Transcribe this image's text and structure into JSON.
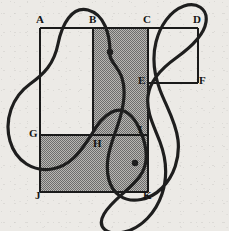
{
  "figure": {
    "canvas": {
      "width": 229,
      "height": 231,
      "background": "#eceae6"
    },
    "style": {
      "line_color": "#1a1a1a",
      "curve_color": "#1e1e1e",
      "shade_color": "#8a8a8a",
      "label_color": "#141414",
      "line_width": 1.2,
      "curve_width": 3.2
    },
    "vertices": [
      {
        "id": "A",
        "label": "A",
        "x": 40,
        "y": 28,
        "label_x": 36,
        "label_y": 14
      },
      {
        "id": "B",
        "label": "B",
        "x": 93,
        "y": 28,
        "label_x": 89,
        "label_y": 14
      },
      {
        "id": "C",
        "label": "C",
        "x": 148,
        "y": 28,
        "label_x": 143,
        "label_y": 14
      },
      {
        "id": "D",
        "label": "D",
        "x": 198,
        "y": 28,
        "label_x": 193,
        "label_y": 14
      },
      {
        "id": "E",
        "label": "E",
        "x": 148,
        "y": 83,
        "label_x": 138,
        "label_y": 75
      },
      {
        "id": "F",
        "label": "F",
        "x": 198,
        "y": 83,
        "label_x": 199,
        "label_y": 75
      },
      {
        "id": "G",
        "label": "G",
        "x": 40,
        "y": 135,
        "label_x": 29,
        "label_y": 128
      },
      {
        "id": "H",
        "label": "H",
        "x": 93,
        "y": 135,
        "label_x": 93,
        "label_y": 138
      },
      {
        "id": "I",
        "label": "I",
        "x": 148,
        "y": 135,
        "label_x": 138,
        "label_y": 124
      },
      {
        "id": "J",
        "label": "J",
        "x": 40,
        "y": 192,
        "label_x": 35,
        "label_y": 190
      },
      {
        "id": "K",
        "label": "K",
        "x": 148,
        "y": 192,
        "label_x": 143,
        "label_y": 190
      }
    ],
    "segments": [
      {
        "name": "top-edge-A-D",
        "from": "A",
        "to": "D"
      },
      {
        "name": "left-edge-A-J",
        "from": "A",
        "to": "J"
      },
      {
        "name": "bottom-edge-J-K",
        "from": "J",
        "to": "K"
      },
      {
        "name": "right-edge-D-F",
        "from": "D",
        "to": "F"
      },
      {
        "name": "vertical-B-H",
        "from": "B",
        "to": "H"
      },
      {
        "name": "vertical-C-K",
        "from": "C",
        "to": "K"
      },
      {
        "name": "horizontal-E-F",
        "from": "E",
        "to": "F"
      },
      {
        "name": "horizontal-G-I",
        "from": "G",
        "to": "I"
      }
    ],
    "shaded_regions": [
      {
        "name": "region-B-C-I-H",
        "points": "93,28 148,28 148,135 93,135"
      },
      {
        "name": "region-G-I-K-J",
        "points": "40,135 148,135 148,192 40,192"
      }
    ],
    "curve": {
      "name": "closed-loop-curve",
      "path": "M 110 52 C 110 34 104 14 88 10 C 72 6 62 24 58 44 C 54 64 44 74 30 84 C 12 97 4 120 10 141 C 16 162 34 172 52 169 C 70 166 80 152 88 140 C 96 128 100 118 112 112 C 124 106 134 116 140 130 C 147 146 150 162 140 176 C 130 190 112 200 104 214 C 96 228 108 236 124 232 C 142 228 156 212 162 194 C 168 176 166 158 160 142 C 154 126 146 112 148 96 C 150 80 162 68 176 58 C 190 48 204 36 206 22 C 208 8 196 2 184 6 C 170 11 160 26 156 42 C 152 58 154 74 160 90 C 166 106 176 122 178 140 C 180 158 174 176 162 188 C 150 200 132 204 120 196 C 108 188 106 172 108 158 C 110 144 116 132 120 118 C 124 104 126 90 122 78 C 118 66 108 60 110 52 Z",
      "endpoint_dots": [
        {
          "name": "curve-endpoint-upper",
          "x": 110,
          "y": 52,
          "r": 3.2
        },
        {
          "name": "curve-endpoint-lower",
          "x": 135,
          "y": 163,
          "r": 3.2
        }
      ]
    }
  }
}
